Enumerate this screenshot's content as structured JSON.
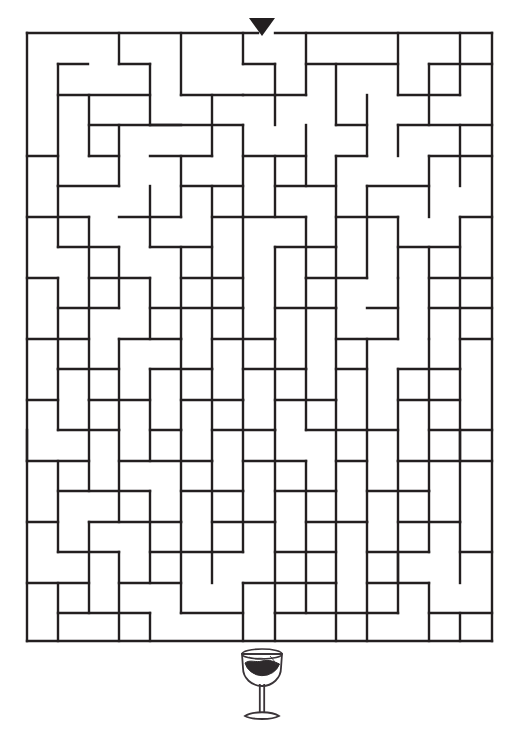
{
  "page": {
    "background_color": "#ffffff",
    "ink_color": "#231f20",
    "width": 517,
    "height": 751
  },
  "puzzle": {
    "type": "maze",
    "title": "",
    "shape": "rectangular-grid",
    "grid": {
      "columns": 15,
      "rows": 20,
      "cell_width": 31,
      "cell_height": 30.4,
      "origin_x": 27,
      "origin_y": 33,
      "wall_thickness": 2.4
    },
    "start": {
      "name": "entrance",
      "marker": "down-triangle",
      "column": 7,
      "x": 262,
      "y": 33,
      "label": ""
    },
    "goal": {
      "name": "wine-glass",
      "icon": "wine-glass-icon",
      "x": 262,
      "y": 690,
      "label": ""
    },
    "border": {
      "top_gap_column": 7,
      "closed": true
    }
  },
  "maze_walls": {
    "note": "Each wall is [x1,y1,x2,y2] in page pixel coordinates.",
    "horizontal": [
      [
        27,
        33,
        258,
        33
      ],
      [
        275,
        33,
        492,
        33
      ],
      [
        58,
        64,
        88,
        64
      ],
      [
        119,
        64,
        150,
        64
      ],
      [
        243,
        64,
        275,
        64
      ],
      [
        306,
        64,
        398,
        64
      ],
      [
        429,
        64,
        492,
        64
      ],
      [
        58,
        95,
        150,
        95
      ],
      [
        181,
        95,
        243,
        95
      ],
      [
        243,
        95,
        275,
        95
      ],
      [
        275,
        95,
        306,
        95
      ],
      [
        398,
        95,
        460,
        95
      ],
      [
        89,
        125,
        181,
        125
      ],
      [
        150,
        125,
        243,
        125
      ],
      [
        336,
        125,
        367,
        125
      ],
      [
        398,
        125,
        492,
        125
      ],
      [
        27,
        156,
        58,
        156
      ],
      [
        89,
        156,
        119,
        156
      ],
      [
        150,
        156,
        212,
        156
      ],
      [
        243,
        156,
        306,
        156
      ],
      [
        336,
        156,
        367,
        156
      ],
      [
        429,
        156,
        492,
        156
      ],
      [
        58,
        186,
        119,
        186
      ],
      [
        181,
        186,
        243,
        186
      ],
      [
        275,
        186,
        336,
        186
      ],
      [
        367,
        186,
        429,
        186
      ],
      [
        27,
        217,
        89,
        217
      ],
      [
        119,
        217,
        181,
        217
      ],
      [
        212,
        217,
        243,
        217
      ],
      [
        243,
        217,
        306,
        217
      ],
      [
        336,
        217,
        398,
        217
      ],
      [
        460,
        217,
        492,
        217
      ],
      [
        58,
        247,
        119,
        247
      ],
      [
        150,
        247,
        212,
        247
      ],
      [
        275,
        247,
        336,
        247
      ],
      [
        398,
        247,
        460,
        247
      ],
      [
        27,
        278,
        58,
        278
      ],
      [
        89,
        278,
        150,
        278
      ],
      [
        181,
        278,
        243,
        278
      ],
      [
        306,
        278,
        367,
        278
      ],
      [
        429,
        278,
        492,
        278
      ],
      [
        58,
        308,
        119,
        308
      ],
      [
        150,
        308,
        243,
        308
      ],
      [
        275,
        308,
        336,
        308
      ],
      [
        367,
        308,
        398,
        308
      ],
      [
        429,
        308,
        492,
        308
      ],
      [
        27,
        339,
        89,
        339
      ],
      [
        119,
        339,
        181,
        339
      ],
      [
        212,
        339,
        275,
        339
      ],
      [
        336,
        339,
        398,
        339
      ],
      [
        460,
        339,
        492,
        339
      ],
      [
        58,
        369,
        119,
        369
      ],
      [
        150,
        369,
        212,
        369
      ],
      [
        243,
        369,
        306,
        369
      ],
      [
        336,
        369,
        367,
        369
      ],
      [
        398,
        369,
        460,
        369
      ],
      [
        27,
        400,
        58,
        400
      ],
      [
        89,
        400,
        150,
        400
      ],
      [
        181,
        400,
        243,
        400
      ],
      [
        275,
        400,
        336,
        400
      ],
      [
        398,
        400,
        460,
        400
      ],
      [
        58,
        430,
        119,
        430
      ],
      [
        150,
        430,
        181,
        430
      ],
      [
        212,
        430,
        275,
        430
      ],
      [
        306,
        430,
        398,
        430
      ],
      [
        429,
        430,
        492,
        430
      ],
      [
        27,
        461,
        89,
        461
      ],
      [
        119,
        461,
        212,
        461
      ],
      [
        243,
        461,
        306,
        461
      ],
      [
        336,
        461,
        367,
        461
      ],
      [
        398,
        461,
        492,
        461
      ],
      [
        58,
        491,
        150,
        491
      ],
      [
        181,
        491,
        243,
        491
      ],
      [
        275,
        491,
        336,
        491
      ],
      [
        367,
        491,
        429,
        491
      ],
      [
        27,
        522,
        58,
        522
      ],
      [
        89,
        522,
        181,
        522
      ],
      [
        212,
        522,
        275,
        522
      ],
      [
        306,
        522,
        367,
        522
      ],
      [
        398,
        522,
        460,
        522
      ],
      [
        58,
        552,
        119,
        552
      ],
      [
        150,
        552,
        243,
        552
      ],
      [
        275,
        552,
        336,
        552
      ],
      [
        367,
        552,
        429,
        552
      ],
      [
        460,
        552,
        492,
        552
      ],
      [
        27,
        583,
        89,
        583
      ],
      [
        119,
        583,
        181,
        583
      ],
      [
        243,
        583,
        336,
        583
      ],
      [
        367,
        583,
        429,
        583
      ],
      [
        58,
        613,
        150,
        613
      ],
      [
        181,
        613,
        243,
        613
      ],
      [
        275,
        613,
        398,
        613
      ],
      [
        429,
        613,
        492,
        613
      ],
      [
        27,
        641,
        492,
        641
      ]
    ],
    "vertical": [
      [
        27,
        33,
        27,
        641
      ],
      [
        492,
        33,
        492,
        641
      ],
      [
        119,
        33,
        119,
        64
      ],
      [
        181,
        33,
        181,
        95
      ],
      [
        243,
        33,
        243,
        64
      ],
      [
        306,
        33,
        306,
        95
      ],
      [
        398,
        33,
        398,
        95
      ],
      [
        460,
        33,
        460,
        95
      ],
      [
        58,
        64,
        58,
        186
      ],
      [
        150,
        64,
        150,
        125
      ],
      [
        275,
        64,
        275,
        125
      ],
      [
        336,
        64,
        336,
        125
      ],
      [
        429,
        64,
        429,
        125
      ],
      [
        89,
        95,
        89,
        156
      ],
      [
        212,
        95,
        212,
        156
      ],
      [
        367,
        95,
        367,
        156
      ],
      [
        119,
        125,
        119,
        186
      ],
      [
        243,
        125,
        243,
        217
      ],
      [
        306,
        125,
        306,
        186
      ],
      [
        398,
        125,
        398,
        156
      ],
      [
        460,
        125,
        460,
        186
      ],
      [
        181,
        156,
        181,
        217
      ],
      [
        275,
        156,
        275,
        217
      ],
      [
        336,
        156,
        336,
        247
      ],
      [
        429,
        156,
        429,
        217
      ],
      [
        58,
        186,
        58,
        247
      ],
      [
        150,
        186,
        150,
        247
      ],
      [
        212,
        186,
        212,
        278
      ],
      [
        367,
        186,
        367,
        278
      ],
      [
        89,
        217,
        89,
        308
      ],
      [
        243,
        217,
        243,
        308
      ],
      [
        306,
        217,
        306,
        278
      ],
      [
        398,
        217,
        398,
        278
      ],
      [
        460,
        217,
        460,
        308
      ],
      [
        119,
        247,
        119,
        308
      ],
      [
        181,
        247,
        181,
        339
      ],
      [
        275,
        247,
        275,
        339
      ],
      [
        336,
        247,
        336,
        308
      ],
      [
        429,
        247,
        429,
        339
      ],
      [
        58,
        278,
        58,
        369
      ],
      [
        150,
        278,
        150,
        339
      ],
      [
        212,
        278,
        212,
        369
      ],
      [
        306,
        278,
        306,
        369
      ],
      [
        398,
        278,
        398,
        339
      ],
      [
        89,
        308,
        89,
        400
      ],
      [
        243,
        308,
        243,
        400
      ],
      [
        336,
        308,
        336,
        400
      ],
      [
        460,
        308,
        460,
        369
      ],
      [
        119,
        339,
        119,
        430
      ],
      [
        181,
        339,
        181,
        430
      ],
      [
        275,
        339,
        275,
        430
      ],
      [
        367,
        339,
        367,
        430
      ],
      [
        429,
        339,
        429,
        400
      ],
      [
        58,
        369,
        58,
        430
      ],
      [
        150,
        369,
        150,
        461
      ],
      [
        212,
        369,
        212,
        461
      ],
      [
        306,
        369,
        306,
        430
      ],
      [
        398,
        369,
        398,
        461
      ],
      [
        460,
        369,
        460,
        461
      ],
      [
        89,
        400,
        89,
        491
      ],
      [
        243,
        400,
        243,
        491
      ],
      [
        336,
        400,
        336,
        491
      ],
      [
        429,
        400,
        429,
        491
      ],
      [
        27,
        430,
        27,
        461
      ],
      [
        119,
        430,
        119,
        522
      ],
      [
        181,
        430,
        181,
        522
      ],
      [
        275,
        430,
        275,
        522
      ],
      [
        367,
        430,
        367,
        522
      ],
      [
        460,
        430,
        460,
        522
      ],
      [
        58,
        461,
        58,
        552
      ],
      [
        212,
        461,
        212,
        552
      ],
      [
        306,
        461,
        306,
        552
      ],
      [
        398,
        461,
        398,
        583
      ],
      [
        150,
        491,
        150,
        583
      ],
      [
        243,
        491,
        243,
        552
      ],
      [
        336,
        491,
        336,
        583
      ],
      [
        429,
        491,
        429,
        552
      ],
      [
        89,
        522,
        89,
        613
      ],
      [
        181,
        522,
        181,
        613
      ],
      [
        275,
        522,
        275,
        613
      ],
      [
        367,
        522,
        367,
        613
      ],
      [
        460,
        522,
        460,
        583
      ],
      [
        119,
        552,
        119,
        641
      ],
      [
        212,
        552,
        212,
        583
      ],
      [
        306,
        552,
        306,
        613
      ],
      [
        398,
        552,
        398,
        613
      ],
      [
        58,
        583,
        58,
        641
      ],
      [
        243,
        583,
        243,
        641
      ],
      [
        336,
        583,
        336,
        641
      ],
      [
        429,
        583,
        429,
        641
      ],
      [
        150,
        613,
        150,
        641
      ],
      [
        275,
        613,
        275,
        641
      ],
      [
        367,
        613,
        367,
        641
      ],
      [
        460,
        613,
        460,
        641
      ]
    ]
  }
}
